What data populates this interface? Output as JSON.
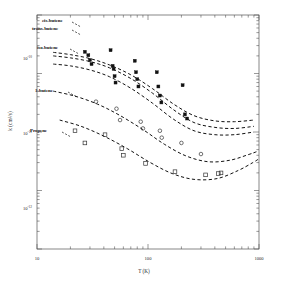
{
  "chart_data": {
    "type": "line",
    "title": "",
    "xlabel": "T (K)",
    "ylabel": "k (cm³/s)",
    "xscale": "log",
    "yscale": "log",
    "xlim": [
      10,
      1000
    ],
    "ylim": [
      1e-13,
      1e-09
    ],
    "grid": false,
    "legend_position": "inline-labels",
    "xticks": [
      {
        "value": 10,
        "label": "10"
      },
      {
        "value": 100,
        "label": "100"
      },
      {
        "value": 1000,
        "label": "1000"
      }
    ],
    "yticks": [
      {
        "value": 1e-10,
        "mantissa": "10",
        "exponent": "-10"
      },
      {
        "value": 1e-11,
        "mantissa": "10",
        "exponent": "-11"
      },
      {
        "value": 1e-12,
        "mantissa": "10",
        "exponent": "-12"
      }
    ],
    "series": [
      {
        "name": "cis-butene",
        "label": "cis-butene",
        "style": "dashed",
        "marker": "filled-square",
        "x": [
          14,
          20,
          30,
          45,
          70,
          110,
          170,
          260,
          400,
          600,
          900
        ],
        "y": [
          2.3e-10,
          2.1e-10,
          1.8e-10,
          1.4e-10,
          9.5e-11,
          5.5e-11,
          3e-11,
          1.9e-11,
          1.55e-11,
          1.5e-11,
          1.6e-11
        ]
      },
      {
        "name": "trans-butene",
        "label": "trans-butene",
        "style": "dashed",
        "marker": "filled-square",
        "x": [
          14,
          20,
          30,
          45,
          70,
          110,
          170,
          260,
          400,
          600,
          900
        ],
        "y": [
          2e-10,
          1.85e-10,
          1.6e-10,
          1.25e-10,
          8.2e-11,
          4.6e-11,
          2.4e-11,
          1.45e-11,
          1.2e-11,
          1.15e-11,
          1.25e-11
        ]
      },
      {
        "name": "iso-butene",
        "label": "iso-butene",
        "style": "dashed",
        "marker": "filled-square",
        "x": [
          14,
          20,
          30,
          45,
          70,
          110,
          170,
          260,
          400,
          600,
          900
        ],
        "y": [
          1.45e-10,
          1.35e-10,
          1.15e-10,
          8.8e-11,
          5.6e-11,
          3.1e-11,
          1.65e-11,
          1.05e-11,
          9e-12,
          9e-12,
          1e-11
        ]
      },
      {
        "name": "1-butene",
        "label": "1-butene",
        "style": "dashed",
        "marker": "open-circle",
        "x": [
          14,
          22,
          35,
          55,
          90,
          140,
          220,
          350,
          550,
          800,
          950
        ],
        "y": [
          5e-11,
          4.1e-11,
          3e-11,
          1.95e-11,
          1.1e-11,
          6.2e-12,
          3.9e-12,
          3.1e-12,
          3.3e-12,
          4.1e-12,
          4.6e-12
        ]
      },
      {
        "name": "Propene",
        "label": "Propene",
        "style": "dashed",
        "marker": "open-square",
        "x": [
          16,
          25,
          40,
          65,
          105,
          165,
          260,
          420,
          650,
          880,
          980
        ],
        "y": [
          1.6e-11,
          1.25e-11,
          8.5e-12,
          5.2e-12,
          3e-12,
          1.95e-12,
          1.55e-12,
          1.6e-12,
          2.2e-12,
          3e-12,
          3.4e-12
        ]
      }
    ],
    "scatter_points": [
      {
        "series": "butenes",
        "marker": "filled-square",
        "x": 27,
        "y": 2.35e-10
      },
      {
        "series": "butenes",
        "marker": "filled-square",
        "x": 29,
        "y": 2.05e-10
      },
      {
        "series": "butenes",
        "marker": "filled-square",
        "x": 30,
        "y": 1.7e-10
      },
      {
        "series": "butenes",
        "marker": "filled-square",
        "x": 31,
        "y": 1.45e-10
      },
      {
        "series": "butenes",
        "marker": "filled-square",
        "x": 46,
        "y": 2.5e-10
      },
      {
        "series": "butenes",
        "marker": "filled-square",
        "x": 48,
        "y": 1.35e-10
      },
      {
        "series": "butenes",
        "marker": "filled-square",
        "x": 49,
        "y": 1.2e-10
      },
      {
        "series": "butenes",
        "marker": "filled-square",
        "x": 50,
        "y": 9e-11
      },
      {
        "series": "butenes",
        "marker": "filled-square",
        "x": 51,
        "y": 7e-11
      },
      {
        "series": "butenes",
        "marker": "filled-square",
        "x": 76,
        "y": 1.65e-10
      },
      {
        "series": "butenes",
        "marker": "filled-square",
        "x": 78,
        "y": 1.05e-10
      },
      {
        "series": "butenes",
        "marker": "filled-square",
        "x": 80,
        "y": 8e-11
      },
      {
        "series": "butenes",
        "marker": "filled-square",
        "x": 82,
        "y": 6e-11
      },
      {
        "series": "butenes",
        "marker": "filled-square",
        "x": 120,
        "y": 1.05e-10
      },
      {
        "series": "butenes",
        "marker": "filled-square",
        "x": 124,
        "y": 6e-11
      },
      {
        "series": "butenes",
        "marker": "filled-square",
        "x": 128,
        "y": 4.2e-11
      },
      {
        "series": "butenes",
        "marker": "filled-square",
        "x": 132,
        "y": 3.2e-11
      },
      {
        "series": "butenes",
        "marker": "filled-square",
        "x": 205,
        "y": 6.3e-11
      },
      {
        "series": "butenes",
        "marker": "filled-square",
        "x": 215,
        "y": 2e-11
      },
      {
        "series": "butenes",
        "marker": "filled-square",
        "x": 225,
        "y": 1.7e-11
      },
      {
        "series": "1-butene",
        "marker": "open-circle",
        "x": 34,
        "y": 3.3e-11
      },
      {
        "series": "1-butene",
        "marker": "open-circle",
        "x": 52,
        "y": 2.5e-11
      },
      {
        "series": "1-butene",
        "marker": "open-circle",
        "x": 56,
        "y": 1.6e-11
      },
      {
        "series": "1-butene",
        "marker": "open-circle",
        "x": 86,
        "y": 1.5e-11
      },
      {
        "series": "1-butene",
        "marker": "open-circle",
        "x": 90,
        "y": 1.15e-11
      },
      {
        "series": "1-butene",
        "marker": "open-circle",
        "x": 128,
        "y": 1.05e-11
      },
      {
        "series": "1-butene",
        "marker": "open-circle",
        "x": 133,
        "y": 8e-12
      },
      {
        "series": "1-butene",
        "marker": "open-circle",
        "x": 200,
        "y": 6.5e-12
      },
      {
        "series": "1-butene",
        "marker": "open-circle",
        "x": 300,
        "y": 4.2e-12
      },
      {
        "series": "Propene",
        "marker": "open-square",
        "x": 22,
        "y": 1.05e-11
      },
      {
        "series": "Propene",
        "marker": "open-square",
        "x": 27,
        "y": 6.5e-12
      },
      {
        "series": "Propene",
        "marker": "open-square",
        "x": 41,
        "y": 9e-12
      },
      {
        "series": "Propene",
        "marker": "open-square",
        "x": 58,
        "y": 5.2e-12
      },
      {
        "series": "Propene",
        "marker": "open-square",
        "x": 60,
        "y": 4e-12
      },
      {
        "series": "Propene",
        "marker": "open-square",
        "x": 95,
        "y": 2.9e-12
      },
      {
        "series": "Propene",
        "marker": "open-square",
        "x": 175,
        "y": 2.1e-12
      },
      {
        "series": "Propene",
        "marker": "open-square",
        "x": 330,
        "y": 1.85e-12
      },
      {
        "series": "Propene",
        "marker": "open-square",
        "x": 430,
        "y": 1.95e-12
      },
      {
        "series": "Propene",
        "marker": "open-square",
        "x": 455,
        "y": 2e-12
      }
    ]
  }
}
